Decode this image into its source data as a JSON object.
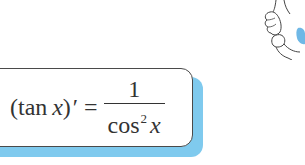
{
  "formula": {
    "lhs_open": "(tan ",
    "lhs_var": "x",
    "lhs_close": ")",
    "prime": "′",
    "equals": "=",
    "numerator": "1",
    "denominator_func": "cos",
    "denominator_exp": "2",
    "denominator_var": "x"
  },
  "colors": {
    "shadow": "#7fcaee",
    "border": "#4a4a4a",
    "mascot_accent": "#6fb8e6"
  },
  "illustration": {
    "icon": "cartoon-hand-icon"
  }
}
